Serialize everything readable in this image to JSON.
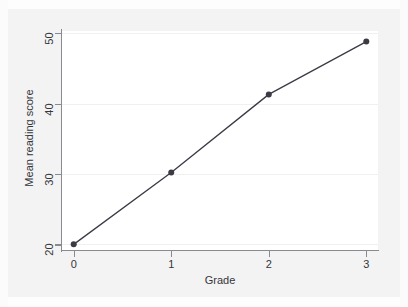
{
  "chart_data": {
    "type": "line",
    "title": "",
    "subtitle": "",
    "xlabel": "Grade",
    "ylabel": "Mean reading score",
    "x": [
      0,
      1,
      2,
      3
    ],
    "values": [
      20.0,
      30.2,
      41.3,
      48.8
    ],
    "series": [
      {
        "name": "Mean reading score",
        "x": [
          0,
          1,
          2,
          3
        ],
        "values": [
          20.0,
          30.2,
          41.3,
          48.8
        ],
        "marker": "circle",
        "line_color": "#3b3b46",
        "marker_color": "#3b3b46"
      }
    ],
    "xlim": [
      -0.12,
      3.12
    ],
    "ylim": [
      19.2,
      50.3
    ],
    "x_ticks": [
      0,
      1,
      2,
      3
    ],
    "x_tick_labels": [
      "0",
      "1",
      "2",
      "3"
    ],
    "y_ticks": [
      20,
      30,
      40,
      50
    ],
    "y_tick_labels": [
      "20",
      "30",
      "40",
      "50"
    ],
    "grid": "horizontal",
    "legend": "none",
    "annotations": []
  },
  "style": {
    "figure_background": "#f3f3f3",
    "plot_background": "#ffffff",
    "gridline_color": "#f0f0f2",
    "axis_color": "#888a92",
    "text_color": "#35353d",
    "line_color": "#3b3b46"
  }
}
